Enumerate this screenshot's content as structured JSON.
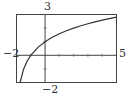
{
  "chart_data": {
    "type": "line",
    "title": "",
    "xlabel": "",
    "ylabel": "",
    "xlim": [
      -2,
      5
    ],
    "ylim": [
      -2,
      3
    ],
    "grid": false,
    "tick_labels": {
      "xmin": "−2",
      "xmax": "5",
      "ymin": "−2",
      "ymax": "3"
    },
    "x_ticks": [
      -1,
      1,
      2,
      3,
      4
    ],
    "y_ticks": [
      -1,
      1,
      2
    ],
    "series": [
      {
        "name": "y = log2(x + 2)",
        "x": [
          -1.75,
          -1.5,
          -1.25,
          -1,
          -0.5,
          0,
          0.5,
          1,
          1.5,
          2,
          2.5,
          3,
          3.5,
          4,
          4.5,
          5
        ],
        "y": [
          -2,
          -1,
          -0.415,
          0,
          0.585,
          1,
          1.322,
          1.585,
          1.807,
          2,
          2.17,
          2.322,
          2.459,
          2.585,
          2.701,
          2.807
        ]
      }
    ]
  }
}
